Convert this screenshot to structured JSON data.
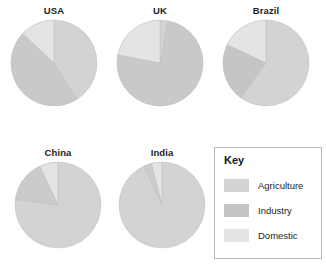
{
  "chart_data": {
    "type": "pie",
    "title": "",
    "legend_position": "bottom-right",
    "categories": [
      "Agriculture",
      "Industry",
      "Domestic"
    ],
    "colors": {
      "Agriculture": "#d3d3d3",
      "Industry": "#c5c5c5",
      "Domestic": "#e4e4e4"
    },
    "charts": [
      {
        "title": "USA",
        "slices": [
          {
            "label": "Agriculture",
            "value": 41,
            "color": "#d3d3d3"
          },
          {
            "label": "Industry",
            "value": 46,
            "color": "#c9c9c9"
          },
          {
            "label": "Domestic",
            "value": 13,
            "color": "#e4e4e4"
          }
        ]
      },
      {
        "title": "UK",
        "slices": [
          {
            "label": "Agriculture",
            "value": 3,
            "color": "#d3d3d3"
          },
          {
            "label": "Industry",
            "value": 75,
            "color": "#c9c9c9"
          },
          {
            "label": "Domestic",
            "value": 22,
            "color": "#e4e4e4"
          }
        ]
      },
      {
        "title": "Brazil",
        "slices": [
          {
            "label": "Agriculture",
            "value": 60,
            "color": "#d3d3d3"
          },
          {
            "label": "Industry",
            "value": 22,
            "color": "#c5c5c5"
          },
          {
            "label": "Domestic",
            "value": 18,
            "color": "#e4e4e4"
          }
        ]
      },
      {
        "title": "China",
        "slices": [
          {
            "label": "Agriculture",
            "value": 77,
            "color": "#d3d3d3"
          },
          {
            "label": "Industry",
            "value": 16,
            "color": "#cbcbcb"
          },
          {
            "label": "Domestic",
            "value": 7,
            "color": "#e4e4e4"
          }
        ]
      },
      {
        "title": "India",
        "slices": [
          {
            "label": "Agriculture",
            "value": 93,
            "color": "#d3d3d3"
          },
          {
            "label": "Industry",
            "value": 3,
            "color": "#cbcbcb"
          },
          {
            "label": "Domestic",
            "value": 4,
            "color": "#e4e4e4"
          }
        ]
      }
    ]
  },
  "legend": {
    "title": "Key",
    "items": [
      {
        "label": "Agriculture",
        "color": "#d3d3d3"
      },
      {
        "label": "Industry",
        "color": "#c5c5c5"
      },
      {
        "label": "Domestic",
        "color": "#e4e4e4"
      }
    ]
  }
}
